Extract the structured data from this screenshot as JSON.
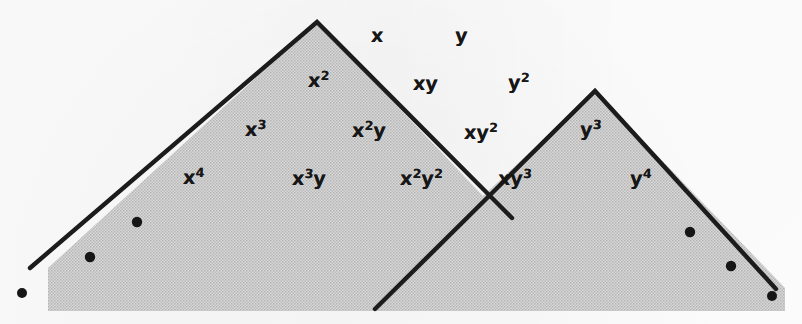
{
  "figure": {
    "kind": "two-overlapping-shaded-triangles-with-monomial-labels",
    "canvas": {
      "width": 802,
      "height": 324
    },
    "colors": {
      "paper": "#fdfdfd",
      "shading": "#c9c9c9",
      "outline": "#1a1a1a",
      "label": "#161616",
      "dot": "#141414"
    },
    "shading_region": {
      "description": "continuous halftone-gray fill beneath both triangles",
      "points": "48,311 48,268 317,22 483,196 595,91 785,288 785,311"
    },
    "triangles": [
      {
        "name": "left-triangle",
        "apex": {
          "x": 317,
          "y": 22
        },
        "left_foot": {
          "x": 30,
          "y": 268
        },
        "right_foot": {
          "x": 512,
          "y": 218
        }
      },
      {
        "name": "right-triangle",
        "apex": {
          "x": 595,
          "y": 91
        },
        "left_foot": {
          "x": 375,
          "y": 309
        },
        "right_foot": {
          "x": 776,
          "y": 289
        }
      }
    ],
    "crossing_point": {
      "x": 483,
      "y": 196
    },
    "dots": [
      {
        "name": "dot-left-outer",
        "cx": 22,
        "cy": 293,
        "r": 5.0
      },
      {
        "name": "dot-left-mid",
        "cx": 90,
        "cy": 257,
        "r": 5.2
      },
      {
        "name": "dot-left-inner",
        "cx": 137,
        "cy": 222,
        "r": 5.2
      },
      {
        "name": "dot-right-inner",
        "cx": 690,
        "cy": 232,
        "r": 5.2
      },
      {
        "name": "dot-right-mid",
        "cx": 731,
        "cy": 266,
        "r": 5.2
      },
      {
        "name": "dot-right-outer",
        "cx": 772,
        "cy": 296,
        "r": 5.0
      }
    ],
    "labels": [
      {
        "name": "label-x",
        "base": "x",
        "exp": "",
        "x": 371,
        "y": 26,
        "region": "outside"
      },
      {
        "name": "label-y",
        "base": "y",
        "exp": "",
        "x": 455,
        "y": 26,
        "region": "outside"
      },
      {
        "name": "label-x2",
        "base": "x",
        "exp": "2",
        "x": 308,
        "y": 71,
        "region": "left-triangle"
      },
      {
        "name": "label-xy",
        "base": "xy",
        "exp": "",
        "x": 413,
        "y": 74,
        "region": "outside"
      },
      {
        "name": "label-y2",
        "base": "y",
        "exp": "2",
        "x": 508,
        "y": 73,
        "region": "outside"
      },
      {
        "name": "label-x3",
        "base": "x",
        "exp": "3",
        "x": 245,
        "y": 120,
        "region": "left-triangle"
      },
      {
        "name": "label-x2y",
        "base": "x",
        "exp": "2",
        "tail": "y",
        "x": 352,
        "y": 121,
        "region": "left-triangle"
      },
      {
        "name": "label-xy2",
        "base": "xy",
        "exp": "2",
        "x": 464,
        "y": 123,
        "region": "outside"
      },
      {
        "name": "label-y3",
        "base": "y",
        "exp": "3",
        "x": 580,
        "y": 120,
        "region": "right-triangle"
      },
      {
        "name": "label-x4",
        "base": "x",
        "exp": "4",
        "x": 183,
        "y": 168,
        "region": "left-triangle"
      },
      {
        "name": "label-x3y",
        "base": "x",
        "exp": "3",
        "tail": "y",
        "x": 292,
        "y": 169,
        "region": "left-triangle"
      },
      {
        "name": "label-x2y2",
        "base": "x",
        "exp": "2",
        "tail": "y",
        "tailexp": "2",
        "x": 400,
        "y": 169,
        "region": "left-triangle"
      },
      {
        "name": "label-xy3",
        "base": "xy",
        "exp": "3",
        "x": 498,
        "y": 169,
        "region": "right-triangle"
      },
      {
        "name": "label-y4",
        "base": "y",
        "exp": "4",
        "x": 630,
        "y": 169,
        "region": "right-triangle"
      }
    ]
  }
}
